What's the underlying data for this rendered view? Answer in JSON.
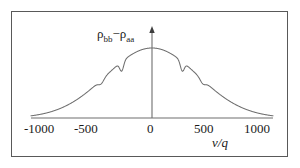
{
  "figure": {
    "background": "#ffffff",
    "frame_color": "#595959",
    "curve_color": "#6e6e6e",
    "axis_color": "#6e6e6e",
    "text_color": "#1a1a1a"
  },
  "axis_labels": {
    "y": "ρ",
    "y_sub1": "bb",
    "y_minus": "−",
    "y_rho2": "ρ",
    "y_sub2": "aa",
    "x_title": "v/q"
  },
  "ticks": {
    "t0": "-1000",
    "t1": "-500",
    "t2": "0",
    "t3": "500",
    "t4": "1000"
  },
  "chart_data": {
    "type": "line",
    "title": "",
    "xlabel": "v/q",
    "ylabel": "ρ_bb − ρ_aa",
    "xlim": [
      -1000,
      1000
    ],
    "ylim": [
      0,
      1
    ],
    "xticks": [
      -1000,
      -500,
      0,
      500,
      1000
    ],
    "yticks": [],
    "grid": false,
    "legend": null,
    "y_axis_arrow": true,
    "envelope": {
      "shape": "gaussian",
      "peak_x": 0,
      "peak_y": 1.0,
      "sigma": 380
    },
    "dips": [
      {
        "center": -420,
        "depth": 0.055,
        "width": 22
      },
      {
        "center": -250,
        "depth": 0.135,
        "width": 16
      },
      {
        "center": 250,
        "depth": 0.135,
        "width": 16
      },
      {
        "center": 420,
        "depth": 0.055,
        "width": 22
      }
    ],
    "x": [
      -1000,
      -950,
      -900,
      -850,
      -800,
      -750,
      -700,
      -650,
      -600,
      -550,
      -500,
      -460,
      -440,
      -430,
      -425,
      -420,
      -415,
      -410,
      -400,
      -380,
      -350,
      -320,
      -290,
      -270,
      -260,
      -255,
      -250,
      -245,
      -240,
      -235,
      -230,
      -210,
      -180,
      -150,
      -120,
      -90,
      -60,
      -30,
      0,
      30,
      60,
      90,
      120,
      150,
      180,
      210,
      230,
      235,
      240,
      245,
      250,
      255,
      260,
      270,
      290,
      320,
      350,
      380,
      400,
      410,
      415,
      420,
      425,
      430,
      440,
      460,
      500,
      550,
      600,
      650,
      700,
      750,
      800,
      850,
      900,
      950,
      1000
    ],
    "y": [
      0.019,
      0.027,
      0.038,
      0.052,
      0.07,
      0.093,
      0.121,
      0.155,
      0.195,
      0.241,
      0.292,
      0.337,
      0.36,
      0.371,
      0.377,
      0.33,
      0.377,
      0.388,
      0.405,
      0.441,
      0.497,
      0.552,
      0.605,
      0.638,
      0.654,
      0.661,
      0.54,
      0.661,
      0.676,
      0.69,
      0.704,
      0.748,
      0.806,
      0.857,
      0.901,
      0.937,
      0.965,
      0.984,
      1.0,
      0.984,
      0.965,
      0.937,
      0.901,
      0.857,
      0.806,
      0.748,
      0.704,
      0.69,
      0.676,
      0.661,
      0.54,
      0.661,
      0.654,
      0.638,
      0.605,
      0.552,
      0.497,
      0.441,
      0.405,
      0.388,
      0.377,
      0.33,
      0.377,
      0.371,
      0.36,
      0.337,
      0.292,
      0.241,
      0.195,
      0.155,
      0.121,
      0.093,
      0.07,
      0.052,
      0.038,
      0.027,
      0.019
    ]
  }
}
